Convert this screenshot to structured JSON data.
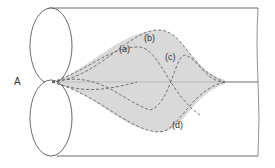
{
  "diagram": {
    "point_label": "A",
    "curve_labels": [
      "(a)",
      "(b)",
      "(c)",
      "(d)"
    ],
    "colors": {
      "line": "#444444",
      "shade": "#c8c8c8",
      "background": "#ffffff"
    }
  }
}
